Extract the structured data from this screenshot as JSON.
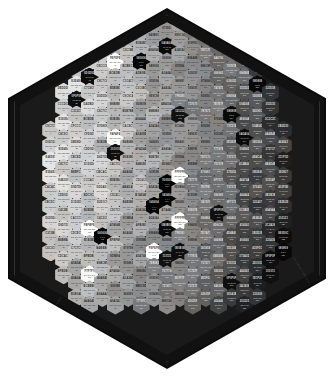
{
  "chart_data": {
    "type": "heatmap",
    "subtitle": "Grayscale / neutral palette laid out on a hexagonal tile grid",
    "layout": {
      "shape": "hexagon",
      "tile_shape": "flat-top-hexagon",
      "columns": 19,
      "rows": 18,
      "tile_width": 17,
      "tile_height": 19,
      "background": "#ffffff",
      "frame_color": "#0a0a0a",
      "grid_color": "#1a1a1a",
      "legend": "none",
      "grid": false
    },
    "label_format": {
      "line1": "hex code",
      "line2": "RGB triplet",
      "line3": "index"
    },
    "edge_labels": {
      "bottom_left": "neutral gradient  ·  light to dark",
      "bottom_right": "hex swatch reference  ·  18 × 19",
      "top_left": "",
      "top_right": ""
    },
    "accent_colors": {
      "black": "#000000",
      "white": "#ffffff",
      "mid": "#808080"
    }
  }
}
